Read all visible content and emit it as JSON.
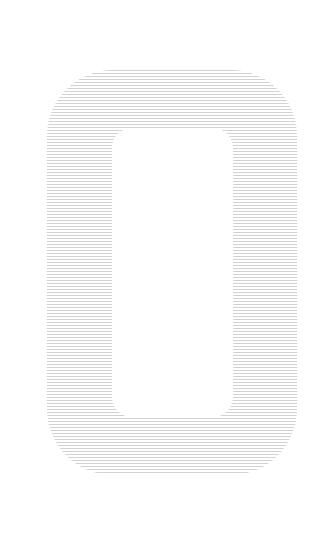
{
  "figure": {
    "description": "Striped rounded-rectangle ring (zero-like shape)",
    "shape": "rounded-rectangle-ring",
    "colors": {
      "background": "#ffffff",
      "stripe": "#d2d2d2"
    },
    "stripe_pattern": {
      "line_thickness_px": 1,
      "period_px": 3,
      "orientation": "horizontal"
    }
  }
}
